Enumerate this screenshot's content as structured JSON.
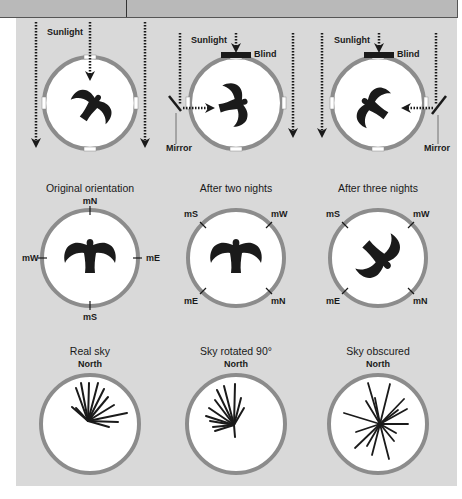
{
  "row1": {
    "panels": [
      {
        "sunlight": "Sunlight"
      },
      {
        "sunlight": "Sunlight",
        "blind": "Blind",
        "mirror": "Mirror"
      },
      {
        "sunlight": "Sunlight",
        "blind": "Blind",
        "mirror": "Mirror"
      }
    ]
  },
  "row2": {
    "panels": [
      {
        "title": "Original orientation",
        "n": "mN",
        "e": "mE",
        "s": "mS",
        "w": "mW"
      },
      {
        "title": "After two nights",
        "tl": "mS",
        "tr": "mW",
        "bl": "mE",
        "br": "mN"
      },
      {
        "title": "After three nights",
        "tl": "mS",
        "tr": "mW",
        "bl": "mE",
        "br": "mN"
      }
    ]
  },
  "row3": {
    "panels": [
      {
        "title": "Real sky",
        "north": "North"
      },
      {
        "title": "Sky rotated 90°",
        "north": "North"
      },
      {
        "title": "Sky obscured",
        "north": "North"
      }
    ]
  },
  "colors": {
    "panel_bg": "#d9d9d9",
    "ring": "#8c8c8c",
    "ink": "#1a1a1a",
    "topbar": "#b9b9b9"
  }
}
